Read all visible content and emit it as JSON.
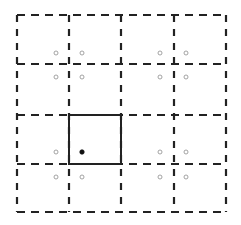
{
  "diagram": {
    "type": "grid-with-highlighted-cell",
    "grid": {
      "rows": 4,
      "cols": 4,
      "x_lines": [
        17,
        69,
        121,
        174,
        226
      ],
      "y_lines": [
        15,
        64,
        115,
        164,
        212
      ],
      "line_style": "dashed",
      "line_color": "#222222"
    },
    "highlighted_cell": {
      "row": 2,
      "col": 1,
      "x": 69,
      "y": 115,
      "width": 52,
      "height": 49,
      "line_style": "solid",
      "line_color": "#222222"
    },
    "points": [
      {
        "x": 56,
        "y": 53,
        "style": "hollow"
      },
      {
        "x": 82,
        "y": 53,
        "style": "hollow"
      },
      {
        "x": 56,
        "y": 77,
        "style": "hollow"
      },
      {
        "x": 82,
        "y": 77,
        "style": "hollow"
      },
      {
        "x": 160,
        "y": 53,
        "style": "hollow"
      },
      {
        "x": 186,
        "y": 53,
        "style": "hollow"
      },
      {
        "x": 160,
        "y": 77,
        "style": "hollow"
      },
      {
        "x": 186,
        "y": 77,
        "style": "hollow"
      },
      {
        "x": 56,
        "y": 152,
        "style": "hollow"
      },
      {
        "x": 82,
        "y": 152,
        "style": "filled"
      },
      {
        "x": 56,
        "y": 177,
        "style": "hollow"
      },
      {
        "x": 82,
        "y": 177,
        "style": "hollow"
      },
      {
        "x": 160,
        "y": 152,
        "style": "hollow"
      },
      {
        "x": 186,
        "y": 152,
        "style": "hollow"
      },
      {
        "x": 160,
        "y": 177,
        "style": "hollow"
      },
      {
        "x": 186,
        "y": 177,
        "style": "hollow"
      }
    ],
    "colors": {
      "line": "#222222",
      "hollow_point": "#999999",
      "filled_point": "#111111",
      "background": "#ffffff"
    }
  }
}
